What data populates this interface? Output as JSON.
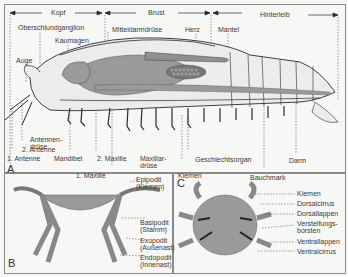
{
  "figure": {
    "panels": {
      "A": {
        "letter": "A",
        "regions": [
          "Kopf",
          "Brust",
          "Hinterleib"
        ],
        "labels_top": [
          "Oberschlundganglion",
          "Kaumagen",
          "Mitteldarmdrüse",
          "Herz",
          "Mantel"
        ],
        "labels_left": [
          "Auge",
          "Antennen-",
          "drüse",
          "2. Antenne",
          "1. Antenne"
        ],
        "labels_bottom": [
          "Mandibel",
          "2. Maxille",
          "Maxillar-",
          "drüse",
          "1. Maxille",
          "Geschlechtsorgan",
          "Kiemen",
          "Darm",
          "Bauchmark"
        ]
      },
      "B": {
        "letter": "B",
        "labels": [
          {
            "line1": "Epipodit",
            "line2": "(Kiemen)"
          },
          {
            "line1": "Basipodit",
            "line2": "(Stamm)"
          },
          {
            "line1": "Exopodit",
            "line2": "(Außenast)"
          },
          {
            "line1": "Endopodit",
            "line2": "(Innenast)"
          }
        ]
      },
      "C": {
        "letter": "C",
        "labels": [
          "Kiemen",
          "Dorsalcirrus",
          "Dorsallappen",
          "Versteifungs-",
          "borsten",
          "Ventrallappen",
          "Ventralcirrus"
        ]
      }
    },
    "colors": {
      "organ_gray": "#9a9a9a",
      "body_light": "#ececea",
      "line": "#2a2a2a",
      "text": "#3a3a3a",
      "frame": "#8a8a8a"
    }
  }
}
